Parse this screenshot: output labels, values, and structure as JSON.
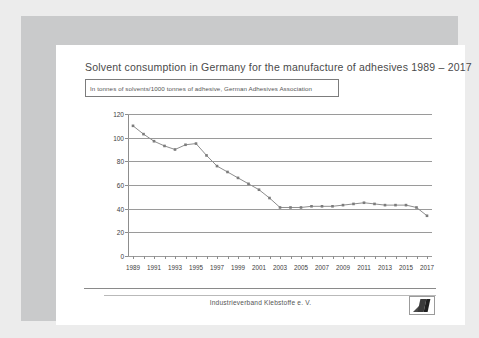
{
  "slide": {
    "title": "Solvent consumption in Germany for the manufacture of adhesives 1989 – 2017",
    "subtitle": "In tonnes of solvents/1000 tonnes of adhesive, German Adhesives Association",
    "footer": "Industrieverband Klebstoffe e. V.",
    "logo_name": "industrieverband-klebstoffe-logo"
  },
  "colors": {
    "line": "#8d8d8d",
    "grid": "#9a9a9a",
    "text": "#4a4a4a",
    "frame": "#c9cacb",
    "background": "#ececec"
  },
  "chart_data": {
    "type": "line",
    "title": "Solvent consumption in Germany for the manufacture of adhesives 1989 – 2017",
    "subtitle": "In tonnes of solvents/1000 tonnes of adhesive, German Adhesives Association",
    "xlabel": "",
    "ylabel": "",
    "ylim": [
      0,
      120
    ],
    "yticks": [
      0,
      20,
      40,
      60,
      80,
      100,
      120
    ],
    "grid": true,
    "legend": false,
    "x": [
      1989,
      1990,
      1991,
      1992,
      1993,
      1994,
      1995,
      1996,
      1997,
      1998,
      1999,
      2000,
      2001,
      2002,
      2003,
      2004,
      2005,
      2006,
      2007,
      2008,
      2009,
      2010,
      2011,
      2012,
      2013,
      2014,
      2015,
      2016,
      2017
    ],
    "xtick_labels": [
      "1989",
      "1991",
      "1993",
      "1995",
      "1997",
      "1999",
      "2001",
      "2003",
      "2005",
      "2007",
      "2009",
      "2011",
      "2013",
      "2015",
      "2017"
    ],
    "values": [
      110,
      103,
      97,
      93,
      90,
      94,
      95,
      85,
      76,
      71,
      66,
      61,
      56,
      49,
      41,
      41,
      41,
      42,
      42,
      42,
      43,
      44,
      45,
      44,
      43,
      43,
      43,
      41,
      34
    ]
  }
}
